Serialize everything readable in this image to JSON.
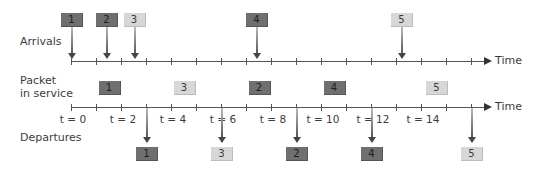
{
  "labels": {
    "arrivals": "Arrivals",
    "packet_in_service_line1": "Packet",
    "packet_in_service_line2": "in service",
    "departures": "Departures",
    "time_top": "Time",
    "time_bottom": "Time"
  },
  "time_ticks": [
    {
      "label": "t = 0",
      "t": 0
    },
    {
      "label": "t = 2",
      "t": 2
    },
    {
      "label": "t = 4",
      "t": 4
    },
    {
      "label": "t = 6",
      "t": 6
    },
    {
      "label": "t = 8",
      "t": 8
    },
    {
      "label": "t = 10",
      "t": 10
    },
    {
      "label": "t = 12",
      "t": 12
    },
    {
      "label": "t = 14",
      "t": 14
    }
  ],
  "arrivals": [
    {
      "id": "1",
      "t": 0.0,
      "shade": "dark"
    },
    {
      "id": "2",
      "t": 1.4,
      "shade": "dark"
    },
    {
      "id": "3",
      "t": 2.5,
      "shade": "light"
    },
    {
      "id": "4",
      "t": 7.4,
      "shade": "dark"
    },
    {
      "id": "5",
      "t": 13.2,
      "shade": "light"
    }
  ],
  "service": [
    {
      "id": "1",
      "start": 0,
      "end": 3,
      "shade": "dark"
    },
    {
      "id": "3",
      "start": 3,
      "end": 6,
      "shade": "light"
    },
    {
      "id": "2",
      "start": 6,
      "end": 9,
      "shade": "dark"
    },
    {
      "id": "4",
      "start": 9,
      "end": 12,
      "shade": "dark"
    },
    {
      "id": "5",
      "start": 13.2,
      "end": 16,
      "shade": "light"
    }
  ],
  "departures": [
    {
      "id": "1",
      "t": 3,
      "shade": "dark"
    },
    {
      "id": "3",
      "t": 6,
      "shade": "light"
    },
    {
      "id": "2",
      "t": 9,
      "shade": "dark"
    },
    {
      "id": "4",
      "t": 12,
      "shade": "dark"
    },
    {
      "id": "5",
      "t": 16,
      "shade": "light"
    }
  ],
  "colors": {
    "dark_packet": "#6f6f6f",
    "light_packet": "#d7d7d7",
    "axis": "#555555"
  }
}
